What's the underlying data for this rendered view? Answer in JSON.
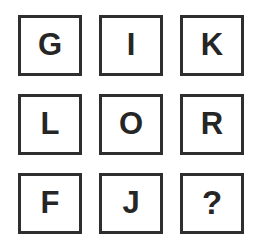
{
  "puzzle": {
    "type": "letter-sequence-grid",
    "rows": 3,
    "columns": 3,
    "background_color": "#ffffff",
    "border_color": "#2e2e2e",
    "glyph_color": "#262626",
    "cells": [
      {
        "id": "cell-r1c1",
        "row": 1,
        "column": 1,
        "label": "G",
        "is_unknown": false
      },
      {
        "id": "cell-r1c2",
        "row": 1,
        "column": 2,
        "label": "I",
        "is_unknown": false
      },
      {
        "id": "cell-r1c3",
        "row": 1,
        "column": 3,
        "label": "K",
        "is_unknown": false
      },
      {
        "id": "cell-r2c1",
        "row": 2,
        "column": 1,
        "label": "L",
        "is_unknown": false
      },
      {
        "id": "cell-r2c2",
        "row": 2,
        "column": 2,
        "label": "O",
        "is_unknown": false
      },
      {
        "id": "cell-r2c3",
        "row": 2,
        "column": 3,
        "label": "R",
        "is_unknown": false
      },
      {
        "id": "cell-r3c1",
        "row": 3,
        "column": 1,
        "label": "F",
        "is_unknown": false
      },
      {
        "id": "cell-r3c2",
        "row": 3,
        "column": 2,
        "label": "J",
        "is_unknown": false
      },
      {
        "id": "cell-r3c3",
        "row": 3,
        "column": 3,
        "label": "?",
        "is_unknown": true
      }
    ]
  }
}
